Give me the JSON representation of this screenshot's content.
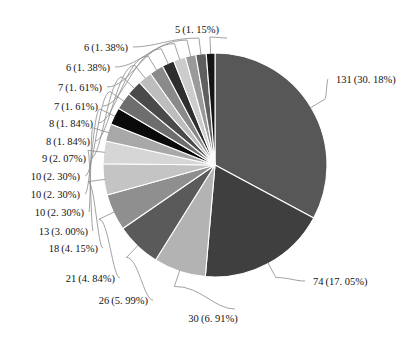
{
  "chart_data": {
    "type": "pie",
    "title": "",
    "subtitle": "",
    "xlabel": "",
    "ylabel": "",
    "legend_position": "none",
    "grid": false,
    "total": 434,
    "label_format": "count (percent%)",
    "start_angle_deg": 90,
    "direction": "clockwise",
    "categories": [
      "131",
      "74",
      "30",
      "26",
      "21",
      "18",
      "13",
      "10",
      "10",
      "10",
      "9",
      "8",
      "8",
      "7",
      "7",
      "6",
      "6",
      "5"
    ],
    "values": [
      131,
      74,
      30,
      26,
      21,
      18,
      13,
      10,
      10,
      10,
      9,
      8,
      8,
      7,
      7,
      6,
      6,
      5
    ],
    "percents": [
      30.18,
      17.05,
      6.91,
      5.99,
      4.84,
      4.15,
      3.0,
      2.3,
      2.3,
      2.3,
      2.07,
      1.84,
      1.84,
      1.61,
      1.61,
      1.38,
      1.38,
      1.15
    ],
    "colors": [
      "#575757",
      "#3f3f3f",
      "#b3b3b3",
      "#5a5a5a",
      "#8f8f8f",
      "#c4c4c4",
      "#d6d6d6",
      "#a8a8a8",
      "#0a0a0a",
      "#6e6e6e",
      "#4a4a4a",
      "#bdbdbd",
      "#8a8a8a",
      "#2e2e2e",
      "#cccccc",
      "#9a9a9a",
      "#5f5f5f",
      "#151515"
    ],
    "slice_separator_color": "#ffffff",
    "leader_line_color": "#8a8a8a",
    "text_color": "#141414",
    "background": "#ffffff",
    "slices": [
      {
        "name": "slice-131",
        "count": 131,
        "percent": 30.18,
        "label": "131 (30. 18%)",
        "color": "#575757",
        "side": "right",
        "label_x": 336,
        "label_y": 79
      },
      {
        "name": "slice-74",
        "count": 74,
        "percent": 17.05,
        "label": "74 (17. 05%)",
        "color": "#3f3f3f",
        "side": "right",
        "label_x": 313,
        "label_y": 281
      },
      {
        "name": "slice-30",
        "count": 30,
        "percent": 6.91,
        "label": "30 (6. 91%)",
        "color": "#b3b3b3",
        "side": "bottom",
        "label_x": 213,
        "label_y": 318
      },
      {
        "name": "slice-26",
        "count": 26,
        "percent": 5.99,
        "label": "26 (5. 99%)",
        "color": "#5a5a5a",
        "side": "left",
        "label_x": 148,
        "label_y": 300
      },
      {
        "name": "slice-21",
        "count": 21,
        "percent": 4.84,
        "label": "21 (4. 84%)",
        "color": "#8f8f8f",
        "side": "left",
        "label_x": 115,
        "label_y": 278
      },
      {
        "name": "slice-18",
        "count": 18,
        "percent": 4.15,
        "label": "18 (4. 15%)",
        "color": "#c4c4c4",
        "side": "left",
        "label_x": 98,
        "label_y": 248
      },
      {
        "name": "slice-13",
        "count": 13,
        "percent": 3.0,
        "label": "13 (3. 00%)",
        "color": "#d6d6d6",
        "side": "left",
        "label_x": 88,
        "label_y": 231
      },
      {
        "name": "slice-10-a",
        "count": 10,
        "percent": 2.3,
        "label": "10 (2. 30%)",
        "color": "#a8a8a8",
        "side": "left",
        "label_x": 84,
        "label_y": 212
      },
      {
        "name": "slice-10-b",
        "count": 10,
        "percent": 2.3,
        "label": "10 (2. 30%)",
        "color": "#0a0a0a",
        "side": "left",
        "label_x": 80,
        "label_y": 194
      },
      {
        "name": "slice-10-c",
        "count": 10,
        "percent": 2.3,
        "label": "10 (2. 30%)",
        "color": "#6e6e6e",
        "side": "left",
        "label_x": 80,
        "label_y": 176
      },
      {
        "name": "slice-9",
        "count": 9,
        "percent": 2.07,
        "label": "9 (2. 07%)",
        "color": "#4a4a4a",
        "side": "left",
        "label_x": 86,
        "label_y": 158
      },
      {
        "name": "slice-8-a",
        "count": 8,
        "percent": 1.84,
        "label": "8 (1. 84%)",
        "color": "#bdbdbd",
        "side": "left",
        "label_x": 90,
        "label_y": 141
      },
      {
        "name": "slice-8-b",
        "count": 8,
        "percent": 1.84,
        "label": "8 (1. 84%)",
        "color": "#8a8a8a",
        "side": "left",
        "label_x": 93,
        "label_y": 123
      },
      {
        "name": "slice-7-a",
        "count": 7,
        "percent": 1.61,
        "label": "7 (1. 61%)",
        "color": "#2e2e2e",
        "side": "left",
        "label_x": 98,
        "label_y": 106
      },
      {
        "name": "slice-7-b",
        "count": 7,
        "percent": 1.61,
        "label": "7 (1. 61%)",
        "color": "#cccccc",
        "side": "left",
        "label_x": 102,
        "label_y": 87
      },
      {
        "name": "slice-6-a",
        "count": 6,
        "percent": 1.38,
        "label": "6 (1. 38%)",
        "color": "#9a9a9a",
        "side": "left",
        "label_x": 110,
        "label_y": 67
      },
      {
        "name": "slice-6-b",
        "count": 6,
        "percent": 1.38,
        "label": "6 (1. 38%)",
        "color": "#5f5f5f",
        "side": "left",
        "label_x": 128,
        "label_y": 47
      },
      {
        "name": "slice-5",
        "count": 5,
        "percent": 1.15,
        "label": "5 (1. 15%)",
        "color": "#151515",
        "side": "top",
        "label_x": 197,
        "label_y": 29
      }
    ],
    "geometry": {
      "center_x": 215,
      "center_y": 165,
      "radius": 112
    }
  }
}
